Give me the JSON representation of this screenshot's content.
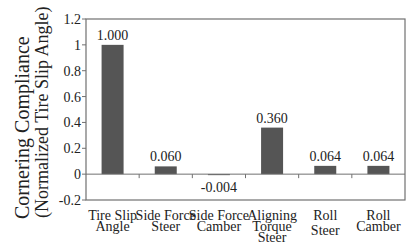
{
  "chart_data": {
    "type": "bar",
    "title": "",
    "xlabel": "",
    "ylabel": [
      "Cornering Compliance",
      "(Normalized Tire Slip Angle)"
    ],
    "categories": [
      [
        "Tire Slip",
        "Angle"
      ],
      [
        "Side Force",
        "Steer"
      ],
      [
        "Side Force",
        "Camber"
      ],
      [
        "Aligning",
        "Torque",
        "Steer"
      ],
      [
        "Roll",
        "Steer"
      ],
      [
        "Roll",
        "Camber"
      ]
    ],
    "values": [
      1.0,
      0.06,
      -0.004,
      0.36,
      0.064,
      0.064
    ],
    "value_labels": [
      "1.000",
      "0.060",
      "-0.004",
      "0.360",
      "0.064",
      "0.064"
    ],
    "ylim": [
      -0.2,
      1.2
    ],
    "yticks": [
      -0.2,
      0,
      0.2,
      0.4,
      0.6,
      0.8,
      1,
      1.2
    ],
    "ytick_labels": [
      "-0.2",
      "0",
      "0.2",
      "0.4",
      "0.6",
      "0.8",
      "1",
      "1.2"
    ],
    "grid": false,
    "legend": "none",
    "bar_color": "#555555",
    "axis_color": "#707070"
  }
}
